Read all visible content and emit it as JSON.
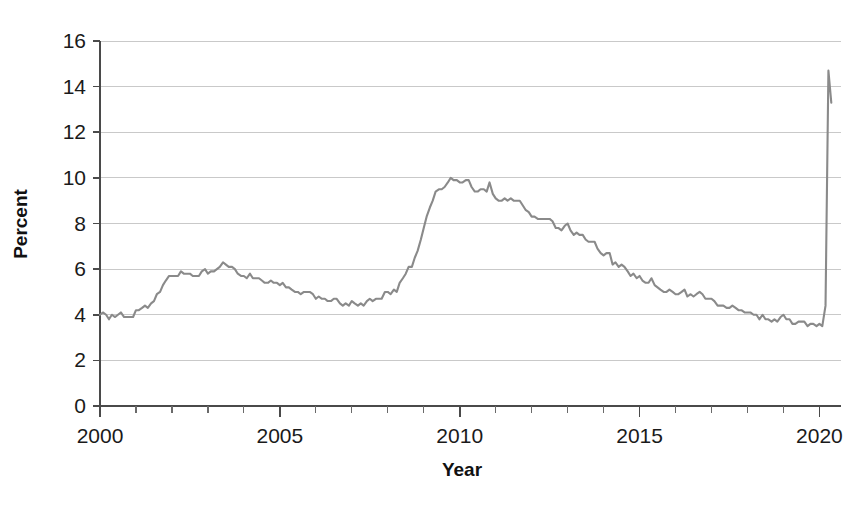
{
  "chart_data": {
    "type": "line",
    "title": "",
    "xlabel": "Year",
    "ylabel": "Percent",
    "xlim": [
      2000,
      2020.6
    ],
    "ylim": [
      0,
      16
    ],
    "grid": true,
    "grid_axis": "y",
    "legend": "none",
    "line_color": "#8a8a8a",
    "axis_color": "#4a4a4a",
    "gridline_color": "#c9c9c9",
    "y_ticks": [
      0,
      2,
      4,
      6,
      8,
      10,
      12,
      14,
      16
    ],
    "y_tick_labels": [
      "0",
      "2",
      "4",
      "6",
      "8",
      "10",
      "12",
      "14",
      "16"
    ],
    "x_major_ticks": [
      2000,
      2005,
      2010,
      2015,
      2020
    ],
    "x_tick_labels": [
      "2000",
      "2005",
      "2010",
      "2015",
      "2020"
    ],
    "x_minor_tick_interval": 1,
    "series": [
      {
        "name": "Unemployment rate",
        "x": [
          2000.0,
          2000.08,
          2000.17,
          2000.25,
          2000.33,
          2000.42,
          2000.5,
          2000.58,
          2000.67,
          2000.75,
          2000.83,
          2000.92,
          2001.0,
          2001.08,
          2001.17,
          2001.25,
          2001.33,
          2001.42,
          2001.5,
          2001.58,
          2001.67,
          2001.75,
          2001.83,
          2001.92,
          2002.0,
          2002.08,
          2002.17,
          2002.25,
          2002.33,
          2002.42,
          2002.5,
          2002.58,
          2002.67,
          2002.75,
          2002.83,
          2002.92,
          2003.0,
          2003.08,
          2003.17,
          2003.25,
          2003.33,
          2003.42,
          2003.5,
          2003.58,
          2003.67,
          2003.75,
          2003.83,
          2003.92,
          2004.0,
          2004.08,
          2004.17,
          2004.25,
          2004.33,
          2004.42,
          2004.5,
          2004.58,
          2004.67,
          2004.75,
          2004.83,
          2004.92,
          2005.0,
          2005.08,
          2005.17,
          2005.25,
          2005.33,
          2005.42,
          2005.5,
          2005.58,
          2005.67,
          2005.75,
          2005.83,
          2005.92,
          2006.0,
          2006.08,
          2006.17,
          2006.25,
          2006.33,
          2006.42,
          2006.5,
          2006.58,
          2006.67,
          2006.75,
          2006.83,
          2006.92,
          2007.0,
          2007.08,
          2007.17,
          2007.25,
          2007.33,
          2007.42,
          2007.5,
          2007.58,
          2007.67,
          2007.75,
          2007.83,
          2007.92,
          2008.0,
          2008.08,
          2008.17,
          2008.25,
          2008.33,
          2008.42,
          2008.5,
          2008.58,
          2008.67,
          2008.75,
          2008.83,
          2008.92,
          2009.0,
          2009.08,
          2009.17,
          2009.25,
          2009.33,
          2009.42,
          2009.5,
          2009.58,
          2009.67,
          2009.75,
          2009.83,
          2009.92,
          2010.0,
          2010.08,
          2010.17,
          2010.25,
          2010.33,
          2010.42,
          2010.5,
          2010.58,
          2010.67,
          2010.75,
          2010.83,
          2010.92,
          2011.0,
          2011.08,
          2011.17,
          2011.25,
          2011.33,
          2011.42,
          2011.5,
          2011.58,
          2011.67,
          2011.75,
          2011.83,
          2011.92,
          2012.0,
          2012.08,
          2012.17,
          2012.25,
          2012.33,
          2012.42,
          2012.5,
          2012.58,
          2012.67,
          2012.75,
          2012.83,
          2012.92,
          2013.0,
          2013.08,
          2013.17,
          2013.25,
          2013.33,
          2013.42,
          2013.5,
          2013.58,
          2013.67,
          2013.75,
          2013.83,
          2013.92,
          2014.0,
          2014.08,
          2014.17,
          2014.25,
          2014.33,
          2014.42,
          2014.5,
          2014.58,
          2014.67,
          2014.75,
          2014.83,
          2014.92,
          2015.0,
          2015.08,
          2015.17,
          2015.25,
          2015.33,
          2015.42,
          2015.5,
          2015.58,
          2015.67,
          2015.75,
          2015.83,
          2015.92,
          2016.0,
          2016.08,
          2016.17,
          2016.25,
          2016.33,
          2016.42,
          2016.5,
          2016.58,
          2016.67,
          2016.75,
          2016.83,
          2016.92,
          2017.0,
          2017.08,
          2017.17,
          2017.25,
          2017.33,
          2017.42,
          2017.5,
          2017.58,
          2017.67,
          2017.75,
          2017.83,
          2017.92,
          2018.0,
          2018.08,
          2018.17,
          2018.25,
          2018.33,
          2018.42,
          2018.5,
          2018.58,
          2018.67,
          2018.75,
          2018.83,
          2018.92,
          2019.0,
          2019.08,
          2019.17,
          2019.25,
          2019.33,
          2019.42,
          2019.5,
          2019.58,
          2019.67,
          2019.75,
          2019.83,
          2019.92,
          2020.0,
          2020.08,
          2020.17,
          2020.25,
          2020.33
        ],
        "values": [
          4.0,
          4.1,
          4.0,
          3.8,
          4.0,
          3.9,
          4.0,
          4.1,
          3.9,
          3.9,
          3.9,
          3.9,
          4.2,
          4.2,
          4.3,
          4.4,
          4.3,
          4.5,
          4.6,
          4.9,
          5.0,
          5.3,
          5.5,
          5.7,
          5.7,
          5.7,
          5.7,
          5.9,
          5.8,
          5.8,
          5.8,
          5.7,
          5.7,
          5.7,
          5.9,
          6.0,
          5.8,
          5.9,
          5.9,
          6.0,
          6.1,
          6.3,
          6.2,
          6.1,
          6.1,
          6.0,
          5.8,
          5.7,
          5.7,
          5.6,
          5.8,
          5.6,
          5.6,
          5.6,
          5.5,
          5.4,
          5.4,
          5.5,
          5.4,
          5.4,
          5.3,
          5.4,
          5.2,
          5.2,
          5.1,
          5.0,
          5.0,
          4.9,
          5.0,
          5.0,
          5.0,
          4.9,
          4.7,
          4.8,
          4.7,
          4.7,
          4.6,
          4.6,
          4.7,
          4.7,
          4.5,
          4.4,
          4.5,
          4.4,
          4.6,
          4.5,
          4.4,
          4.5,
          4.4,
          4.6,
          4.7,
          4.6,
          4.7,
          4.7,
          4.7,
          5.0,
          5.0,
          4.9,
          5.1,
          5.0,
          5.4,
          5.6,
          5.8,
          6.1,
          6.1,
          6.5,
          6.8,
          7.3,
          7.8,
          8.3,
          8.7,
          9.0,
          9.4,
          9.5,
          9.5,
          9.6,
          9.8,
          10.0,
          9.9,
          9.9,
          9.8,
          9.8,
          9.9,
          9.9,
          9.6,
          9.4,
          9.4,
          9.5,
          9.5,
          9.4,
          9.8,
          9.3,
          9.1,
          9.0,
          9.0,
          9.1,
          9.0,
          9.1,
          9.0,
          9.0,
          9.0,
          8.8,
          8.6,
          8.5,
          8.3,
          8.3,
          8.2,
          8.2,
          8.2,
          8.2,
          8.2,
          8.1,
          7.8,
          7.8,
          7.7,
          7.9,
          8.0,
          7.7,
          7.5,
          7.6,
          7.5,
          7.5,
          7.3,
          7.2,
          7.2,
          7.2,
          6.9,
          6.7,
          6.6,
          6.7,
          6.7,
          6.2,
          6.3,
          6.1,
          6.2,
          6.1,
          5.9,
          5.7,
          5.8,
          5.6,
          5.7,
          5.5,
          5.4,
          5.4,
          5.6,
          5.3,
          5.2,
          5.1,
          5.0,
          5.0,
          5.1,
          5.0,
          4.9,
          4.9,
          5.0,
          5.1,
          4.8,
          4.9,
          4.8,
          4.9,
          5.0,
          4.9,
          4.7,
          4.7,
          4.7,
          4.6,
          4.4,
          4.4,
          4.4,
          4.3,
          4.3,
          4.4,
          4.3,
          4.2,
          4.2,
          4.1,
          4.1,
          4.1,
          4.0,
          4.0,
          3.8,
          4.0,
          3.8,
          3.8,
          3.7,
          3.8,
          3.7,
          3.9,
          4.0,
          3.8,
          3.8,
          3.6,
          3.6,
          3.7,
          3.7,
          3.7,
          3.5,
          3.6,
          3.6,
          3.5,
          3.6,
          3.5,
          4.4,
          14.7,
          13.3
        ]
      }
    ]
  },
  "axes": {
    "y_title": "Percent",
    "x_title": "Year"
  }
}
